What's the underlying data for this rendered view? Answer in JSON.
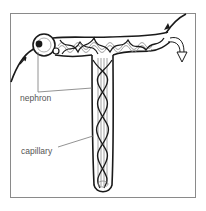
{
  "diagram": {
    "title_fragment": "",
    "labels": {
      "nephron": "nephron",
      "capillary": "capillary"
    },
    "colors": {
      "line": "#1a1a1a",
      "frame": "#8a8a8a",
      "label": "#555555",
      "leader": "#777777"
    }
  }
}
